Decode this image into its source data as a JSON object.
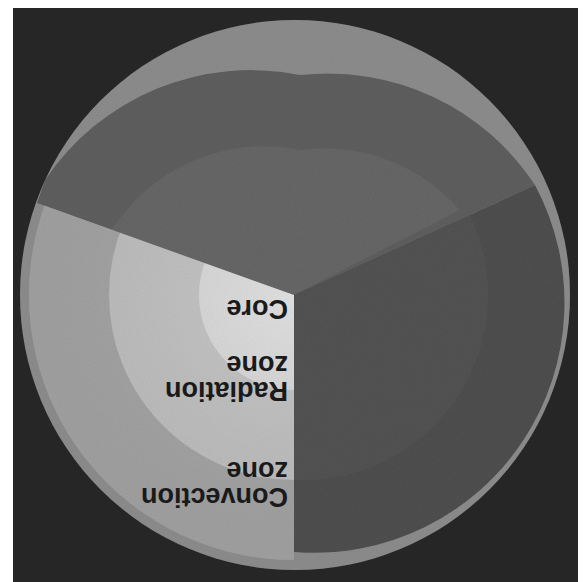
{
  "diagram": {
    "orientation": "rotated 180 degrees",
    "labels": {
      "core": "Core",
      "radiation_line1": "Radiation",
      "radiation_line2": "zone",
      "convection_line1": "Convection",
      "convection_line2": "zone"
    },
    "layers": [
      {
        "name": "Core",
        "color": "#dcdcdc"
      },
      {
        "name": "Radiation zone",
        "color": "#c4c4c4"
      },
      {
        "name": "Convection zone",
        "color": "#a8a8a8"
      },
      {
        "name": "Photosphere",
        "color": "#8c8c8c"
      }
    ],
    "colors": {
      "background": "#262626",
      "sphere_interior_dark": "#555555",
      "sphere_face_top": "#5e5e5e",
      "sphere_face_right": "#4e4e4e",
      "label_text": "#1a1a1a"
    }
  }
}
